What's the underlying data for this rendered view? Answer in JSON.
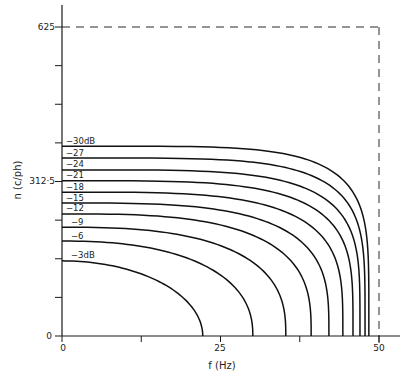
{
  "chart_data": {
    "type": "line",
    "title": "",
    "xlabel": "f (Hz)",
    "ylabel": "n (c/ph)",
    "xlim": [
      0,
      50
    ],
    "ylim": [
      0,
      625
    ],
    "x_ticks": [
      0,
      12.5,
      25,
      37.5,
      50
    ],
    "x_tick_labels": [
      "0",
      "",
      "25",
      "",
      "50"
    ],
    "y_ticks": [
      0,
      78.125,
      156.25,
      234.375,
      312.5,
      390.625,
      468.75,
      546.875,
      625
    ],
    "y_tick_labels": [
      "0",
      "",
      "",
      "",
      "312·5",
      "",
      "",
      "",
      "625"
    ],
    "grid": false,
    "legend": "inline labels at left end of each curve",
    "reference_lines": [
      {
        "type": "horizontal-dashed",
        "y": 625,
        "x_range": [
          0,
          50
        ]
      },
      {
        "type": "vertical-dashed",
        "x": 50,
        "y_range": [
          0,
          625
        ]
      }
    ],
    "series": [
      {
        "name": "-3dB",
        "label": "−3dB",
        "n_at_f0": 152,
        "f_at_n0": 22.2
      },
      {
        "name": "-6",
        "label": "−6",
        "n_at_f0": 192,
        "f_at_n0": 30.1
      },
      {
        "name": "-9",
        "label": "−9",
        "n_at_f0": 220,
        "f_at_n0": 35.3
      },
      {
        "name": "-12",
        "label": "−12",
        "n_at_f0": 247,
        "f_at_n0": 39.3
      },
      {
        "name": "-15",
        "label": "−15",
        "n_at_f0": 269,
        "f_at_n0": 42.1
      },
      {
        "name": "-18",
        "label": "−18",
        "n_at_f0": 291,
        "f_at_n0": 44.3
      },
      {
        "name": "-21",
        "label": "−21",
        "n_at_f0": 314,
        "f_at_n0": 45.9
      },
      {
        "name": "-24",
        "label": "−24",
        "n_at_f0": 336,
        "f_at_n0": 47.0
      },
      {
        "name": "-27",
        "label": "−27",
        "n_at_f0": 360,
        "f_at_n0": 47.8
      },
      {
        "name": "-30dB",
        "label": "−30dB",
        "n_at_f0": 384,
        "f_at_n0": 48.4
      }
    ]
  },
  "labels": {
    "x_axis_title": "f (Hz)",
    "y_axis_title": "n (c/ph)",
    "y_top": "625",
    "y_mid": "312·5",
    "y_zero": "0",
    "x_zero": "0",
    "x_mid": "25",
    "x_end": "50"
  }
}
